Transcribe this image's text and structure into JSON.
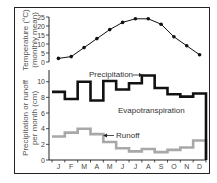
{
  "chart_data": [
    {
      "type": "line",
      "title": "",
      "ylabel": "Temperature (°C) (monthly mean)",
      "ylabel_lines": [
        "Temperature (°C)",
        "(monthly mean)"
      ],
      "xlabel": "",
      "categories": [
        "J",
        "F",
        "M",
        "A",
        "M",
        "J",
        "J",
        "A",
        "S",
        "O",
        "N",
        "D"
      ],
      "ylim": [
        0,
        25
      ],
      "yticks": [
        0,
        5,
        10,
        15,
        20,
        25
      ],
      "grid": false,
      "series": [
        {
          "name": "Temperature",
          "values": [
            2,
            3,
            8,
            13,
            18,
            22,
            24,
            24,
            21,
            14,
            9,
            4
          ],
          "color": "#111111",
          "markers": true
        }
      ]
    },
    {
      "type": "line",
      "step": true,
      "title": "",
      "ylabel": "Precipitation or runoff per month (cm)",
      "ylabel_lines": [
        "Precipitation or runoff",
        "per month (cm)"
      ],
      "xlabel": "",
      "categories": [
        "J",
        "F",
        "M",
        "A",
        "M",
        "J",
        "J",
        "A",
        "S",
        "O",
        "N",
        "D"
      ],
      "ylim": [
        0,
        11.5
      ],
      "yticks": [
        0,
        2,
        4,
        6,
        8,
        10
      ],
      "grid": false,
      "series": [
        {
          "name": "Precipitation",
          "values": [
            8.7,
            7.8,
            10.0,
            7.6,
            10.1,
            9.0,
            9.8,
            10.8,
            9.2,
            8.4,
            8.1,
            8.5
          ],
          "color": "#111111"
        },
        {
          "name": "Runoff",
          "values": [
            3.0,
            3.5,
            4.0,
            3.3,
            2.3,
            1.5,
            1.1,
            1.4,
            1.0,
            1.3,
            1.6,
            2.5
          ],
          "color": "#a8a8a8"
        }
      ],
      "annotations": [
        {
          "text": "Precipitation",
          "points_to": "Precipitation line (Aug)"
        },
        {
          "text": "Evapotranspiration",
          "region": "between precipitation and runoff"
        },
        {
          "text": "Runoff",
          "points_to": "Runoff line (May)"
        }
      ]
    }
  ],
  "labels": {
    "temp_ylabel_1": "Temperature (°C)",
    "temp_ylabel_2": "(monthly mean)",
    "precip_ylabel_1": "Precipitation or runoff",
    "precip_ylabel_2": "per month (cm)",
    "precipitation": "Precipitation",
    "evapotranspiration": "Evapotranspiration",
    "runoff": "Runoff"
  }
}
